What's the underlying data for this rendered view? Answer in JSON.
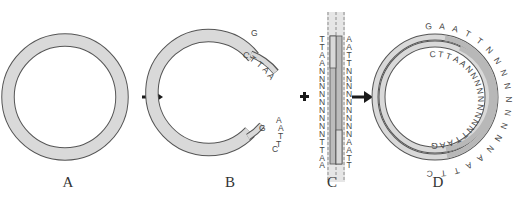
{
  "diagram": {
    "type": "molecular-cloning-schematic",
    "colors": {
      "plasmid_fill": "#d9d9d9",
      "plasmid_stroke": "#555555",
      "insert_fill": "#b8b8b8",
      "arrow": "#1a1a1a",
      "text": "#444444"
    },
    "panels": [
      {
        "id": "A",
        "label": "A",
        "description": "Intact circular plasmid"
      },
      {
        "id": "B",
        "label": "B",
        "description": "Linearized plasmid with sticky ends",
        "top_end_single_strand": [
          "G"
        ],
        "top_end_overhang": [
          "C",
          "T",
          "T",
          "A",
          "A"
        ],
        "bottom_end_single_strand": [
          "G"
        ],
        "bottom_end_overhang": [
          "A",
          "A",
          "T",
          "T",
          "C"
        ]
      },
      {
        "id": "C",
        "label": "C",
        "description": "Double-stranded insert fragment",
        "left_strand": [
          "T",
          "T",
          "A",
          "A",
          "N",
          "N",
          "N",
          "N",
          "N",
          "N",
          "N",
          "N",
          "N",
          "T",
          "T",
          "A",
          "A"
        ],
        "right_strand": [
          "A",
          "A",
          "T",
          "T",
          "N",
          "N",
          "N",
          "N",
          "N",
          "N",
          "N",
          "N",
          "N",
          "A",
          "A",
          "T",
          "T"
        ]
      },
      {
        "id": "D",
        "label": "D",
        "description": "Recombinant plasmid with inserted fragment",
        "outer_sequence": [
          "G",
          "A",
          "A",
          "T",
          "T",
          "N",
          "N",
          "N",
          "N",
          "N",
          "N",
          "N",
          "N",
          "N",
          "A",
          "A",
          "T",
          "T",
          "C"
        ],
        "inner_sequence": [
          "C",
          "T",
          "T",
          "A",
          "A",
          "N",
          "N",
          "N",
          "N",
          "N",
          "N",
          "N",
          "N",
          "N",
          "T",
          "T",
          "A",
          "A",
          "G"
        ]
      }
    ],
    "operators": [
      {
        "id": "arrow-1",
        "symbol": "→",
        "between": [
          "A",
          "B"
        ]
      },
      {
        "id": "plus",
        "symbol": "+",
        "between": [
          "B",
          "C"
        ]
      },
      {
        "id": "arrow-2",
        "symbol": "→",
        "between": [
          "C",
          "D"
        ]
      }
    ]
  },
  "labels": {
    "a": "A",
    "b": "B",
    "c": "C",
    "d": "D"
  },
  "plus_sign": "+"
}
